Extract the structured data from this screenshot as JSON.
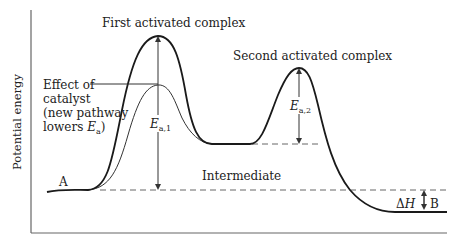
{
  "diagram": {
    "type": "reaction energy profile",
    "y_axis_label": "Potential energy",
    "labels": {
      "first_complex": "First activated complex",
      "second_complex": "Second activated complex",
      "intermediate": "Intermediate",
      "reactant": "A",
      "product": "B",
      "catalyst_note": {
        "line1": "Effect of",
        "line2": "catalyst",
        "line3": "(new pathway",
        "line4_prefix": "lowers ",
        "line4_symbol": "E",
        "line4_subscript": "a",
        "line4_suffix": ")"
      },
      "ea1": {
        "symbol": "E",
        "subscript": "a,1"
      },
      "ea2": {
        "symbol": "E",
        "subscript": "a,2"
      },
      "delta_h": {
        "prefix": "Δ",
        "symbol": "H"
      }
    },
    "curves": [
      {
        "name": "uncatalyzed pathway",
        "style": "thick"
      },
      {
        "name": "catalyzed pathway",
        "style": "thin"
      }
    ],
    "levels": {
      "reactant": "A",
      "intermediate": "Intermediate",
      "product": "B"
    },
    "colors": {
      "line": "#1a1a1a",
      "axis": "#555555",
      "dashed": "#555555"
    }
  }
}
